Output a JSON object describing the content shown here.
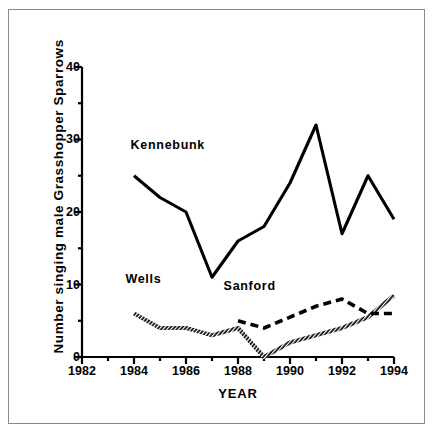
{
  "figure": {
    "background_color": "#ffffff",
    "frame_color": "#8a8a8a",
    "ink_color": "#000000"
  },
  "chart_data": {
    "type": "line",
    "title": "",
    "xlabel": "YEAR",
    "ylabel": "Number  singing  male  Grasshopper  Sparrows",
    "xlim": [
      1982,
      1994
    ],
    "ylim": [
      0,
      40
    ],
    "xticks": [
      1982,
      1984,
      1986,
      1988,
      1990,
      1992,
      1994
    ],
    "xtick_labels": [
      "1982",
      "1984",
      "1986",
      "1988",
      "1990",
      "1992",
      "1994"
    ],
    "xminor_ticks": [
      1983,
      1985,
      1987,
      1989,
      1991,
      1993
    ],
    "yticks": [
      0,
      10,
      20,
      30,
      40
    ],
    "ytick_labels": [
      "0",
      "10",
      "20",
      "30",
      "40"
    ],
    "yminor_ticks": [
      5,
      15,
      25,
      35
    ],
    "grid": false,
    "legend_position": "inline-annotations",
    "series": [
      {
        "name": "Kennebunk",
        "style": "solid",
        "label_x": 1984.1,
        "label_y": 27.5,
        "x": [
          1984,
          1985,
          1986,
          1987,
          1988,
          1989,
          1990,
          1991,
          1992,
          1993,
          1994
        ],
        "values": [
          25,
          22,
          20,
          11,
          16,
          18,
          24,
          32,
          17,
          25,
          19
        ]
      },
      {
        "name": "Wells",
        "style": "hatched",
        "label_x": 1983.9,
        "label_y": 9.0,
        "x": [
          1984,
          1985,
          1986,
          1987,
          1988,
          1989,
          1990,
          1991,
          1992,
          1993,
          1994
        ],
        "values": [
          6,
          4,
          4,
          3,
          4,
          0,
          2,
          3,
          4,
          5.5,
          8.5
        ]
      },
      {
        "name": "Sanford",
        "style": "dashed",
        "label_x": 1987.6,
        "label_y": 8.0,
        "x": [
          1988,
          1989,
          1990,
          1991,
          1992,
          1993,
          1994
        ],
        "values": [
          5,
          4,
          5.5,
          7,
          8,
          6,
          6
        ]
      }
    ]
  }
}
